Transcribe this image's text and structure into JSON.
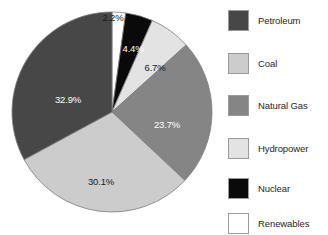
{
  "chart_data": {
    "type": "pie",
    "title": "",
    "subtitle": "",
    "xlabel": "",
    "ylabel": "",
    "grid": false,
    "legend_position": "right",
    "start_angle_deg": 0,
    "direction": "clockwise",
    "categories": [
      "Renewables",
      "Nuclear",
      "Hydropower",
      "Natural Gas",
      "Coal",
      "Petroleum"
    ],
    "values": [
      2.2,
      4.4,
      6.7,
      23.7,
      30.1,
      32.9
    ],
    "value_unit": "%",
    "slices": [
      {
        "name": "Renewables",
        "value": 2.2,
        "label": "2.2%",
        "color": "#ffffff",
        "label_color": "on-light",
        "label_placement": "outside",
        "label_x": 113,
        "label_y": 17
      },
      {
        "name": "Nuclear",
        "value": 4.4,
        "label": "4.4%",
        "color": "#0a0a0a",
        "label_color": "on-dark",
        "label_placement": "inside",
        "label_x": 133,
        "label_y": 48
      },
      {
        "name": "Hydropower",
        "value": 6.7,
        "label": "6.7%",
        "color": "#e3e3e3",
        "label_color": "on-light",
        "label_placement": "inside",
        "label_x": 155,
        "label_y": 67
      },
      {
        "name": "Natural Gas",
        "value": 23.7,
        "label": "23.7%",
        "color": "#858585",
        "label_color": "on-dark",
        "label_placement": "inside",
        "label_x": 167,
        "label_y": 124
      },
      {
        "name": "Coal",
        "value": 30.1,
        "label": "30.1%",
        "color": "#cccccc",
        "label_color": "on-light",
        "label_placement": "inside",
        "label_x": 101,
        "label_y": 181
      },
      {
        "name": "Petroleum",
        "value": 32.9,
        "label": "32.9%",
        "color": "#474747",
        "label_color": "on-dark",
        "label_placement": "inside",
        "label_x": 68,
        "label_y": 99
      }
    ],
    "geometry": {
      "center_x": 112,
      "center_y": 112,
      "radius": 100
    }
  },
  "legend": {
    "items": [
      {
        "label": "Petroleum",
        "color": "#474747"
      },
      {
        "label": "Coal",
        "color": "#cccccc"
      },
      {
        "label": "Natural Gas",
        "color": "#858585"
      },
      {
        "label": "Hydropower",
        "color": "#e3e3e3"
      },
      {
        "label": "Nuclear",
        "color": "#0a0a0a"
      },
      {
        "label": "Renewables",
        "color": "#ffffff"
      }
    ],
    "row_tops": [
      5,
      48,
      90,
      133,
      173,
      208
    ]
  }
}
